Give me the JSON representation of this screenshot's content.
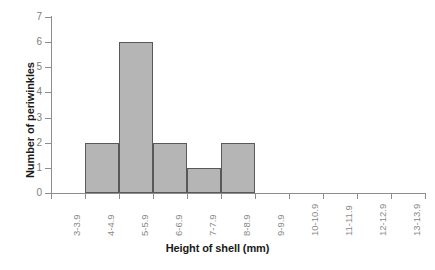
{
  "chart_data": {
    "type": "bar",
    "title": "",
    "subtitle": "",
    "xlabel": "Height of shell (mm)",
    "ylabel": "Number of periwinkles",
    "categories": [
      "3-3.9",
      "4-4.9",
      "5-5.9",
      "6-6.9",
      "7-7.9",
      "8-8.9",
      "9-9.9",
      "10-10.9",
      "11-11.9",
      "12-12.9",
      "13-13.9"
    ],
    "values": [
      0,
      2,
      6,
      2,
      1,
      2,
      0,
      0,
      0,
      0,
      0
    ],
    "xlim_categories": 11,
    "ylim": [
      0,
      7
    ],
    "yticks": [
      0,
      1,
      2,
      3,
      4,
      5,
      6,
      7
    ],
    "ytick_labels": [
      "0",
      "1",
      "2",
      "3",
      "4",
      "5",
      "6",
      "7"
    ],
    "grid": false,
    "legend": null,
    "legend_position": "none",
    "annotations": [],
    "bar_fill_color": "#b5b5b5",
    "bar_edge_color": "#58595b",
    "axis_color": "#8d8d8d",
    "tick_label_color": "#8a8a8a",
    "axis_title_color": "#1a1a1a"
  }
}
